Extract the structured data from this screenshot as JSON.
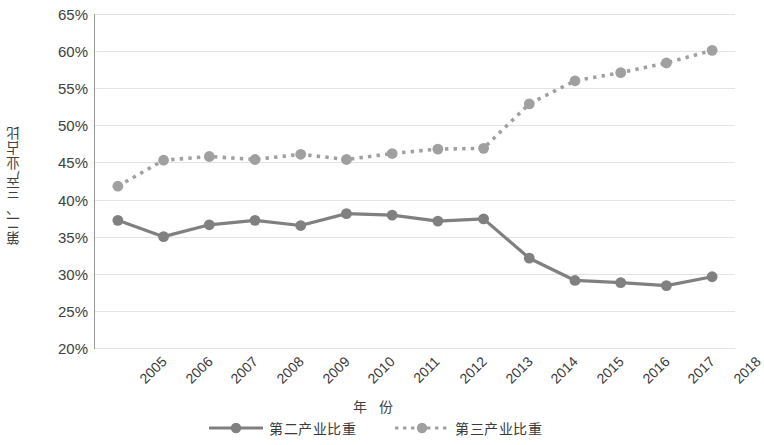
{
  "chart_data": {
    "type": "line",
    "title": "",
    "subtitle": "",
    "xlabel": "年 份",
    "ylabel": "第二、三产业占比",
    "categories": [
      "2005",
      "2006",
      "2007",
      "2008",
      "2009",
      "2010",
      "2011",
      "2012",
      "2013",
      "2014",
      "2015",
      "2016",
      "2017",
      "2018"
    ],
    "x": [
      2005,
      2006,
      2007,
      2008,
      2009,
      2010,
      2011,
      2012,
      2013,
      2014,
      2015,
      2016,
      2017,
      2018
    ],
    "ylim": [
      20,
      65
    ],
    "ytick_labels": [
      "65%",
      "60%",
      "55%",
      "50%",
      "45%",
      "40%",
      "35%",
      "30%",
      "25%",
      "20%"
    ],
    "ytick_values": [
      65,
      60,
      55,
      50,
      45,
      40,
      35,
      30,
      25,
      20
    ],
    "ytick_unit": "%",
    "grid": true,
    "legend_position": "bottom",
    "series": [
      {
        "name": "第二产业比重",
        "line_style": "solid",
        "marker": "circle",
        "color": "#808080",
        "values": [
          37.2,
          35.0,
          36.6,
          37.2,
          36.5,
          38.1,
          37.9,
          37.1,
          37.4,
          32.1,
          29.1,
          28.8,
          28.4,
          29.6
        ]
      },
      {
        "name": "第三产业比重",
        "line_style": "dotted",
        "marker": "circle",
        "color": "#a0a0a0",
        "values": [
          41.8,
          45.3,
          45.8,
          45.4,
          46.1,
          45.4,
          46.2,
          46.8,
          46.9,
          52.9,
          56.0,
          57.1,
          58.4,
          60.1
        ]
      }
    ]
  },
  "legend": {
    "items": [
      {
        "label": "第二产业比重"
      },
      {
        "label": "第三产业比重"
      }
    ]
  },
  "axes": {
    "y_title": "第二、三产业占比",
    "x_title": "年 份"
  },
  "colors": {
    "series_secondary": "#808080",
    "series_tertiary": "#a0a0a0",
    "gridline": "#e3e3e3",
    "axis": "#9a9a9a",
    "text": "#3f3f3f",
    "background": "#ffffff"
  }
}
